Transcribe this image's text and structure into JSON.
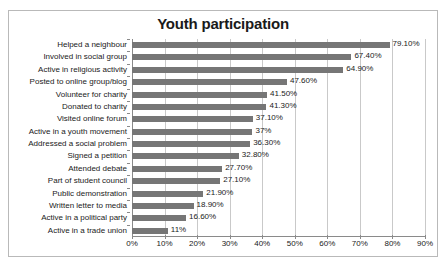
{
  "chart_data": {
    "type": "bar",
    "orientation": "horizontal",
    "title": "Youth participation",
    "xlabel": "",
    "ylabel": "",
    "xlim": [
      0,
      90
    ],
    "grid": true,
    "legend": "none",
    "xtick_labels": [
      "0%",
      "10%",
      "20%",
      "30%",
      "40%",
      "50%",
      "60%",
      "70%",
      "80%",
      "90%"
    ],
    "xtick_values": [
      0,
      10,
      20,
      30,
      40,
      50,
      60,
      70,
      80,
      90
    ],
    "bar_color": "#767676",
    "categories": [
      "Helped a neighbour",
      "Involved in social group",
      "Active in religious activity",
      "Posted to online group/blog",
      "Volunteer for charity",
      "Donated to charity",
      "Visited online forum",
      "Active in a youth movement",
      "Addressed a social problem",
      "Signed a petition",
      "Attended debate",
      "Part of student council",
      "Public demonstration",
      "Written letter to media",
      "Active in a political party",
      "Active in a trade union"
    ],
    "values": [
      79.1,
      67.4,
      64.9,
      47.6,
      41.5,
      41.3,
      37.1,
      37,
      36.3,
      32.8,
      27.7,
      27.1,
      21.9,
      18.9,
      16.6,
      11
    ],
    "value_labels": [
      "79.10%",
      "67.40%",
      "64.90%",
      "47.60%",
      "41.50%",
      "41.30%",
      "37.10%",
      "37%",
      "36.30%",
      "32.80%",
      "27.70%",
      "27.10%",
      "21.90%",
      "18.90%",
      "16.60%",
      "11%"
    ]
  },
  "caption": ""
}
